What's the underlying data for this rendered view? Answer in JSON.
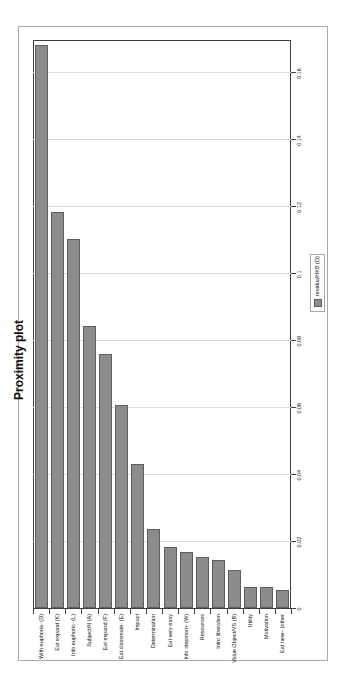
{
  "title": "Proximity plot",
  "legend": {
    "label": "residualHKB (D)"
  },
  "colors": {
    "bar_fill": "#8c8c8c",
    "bar_border": "#5e5e5e",
    "gridline": "#dcdcdc",
    "axis": "#3f3f3f",
    "chart_border": "#a8a8a8",
    "text": "#111111",
    "background": "#ffffff"
  },
  "chart_data": {
    "type": "bar",
    "orientation": "horizontal-bars",
    "rendered_rotation": "whole chart rotated 90 degrees counterclockwise in screenshot",
    "title": "Proximity plot",
    "xlabel": "",
    "ylabel": "",
    "grid": true,
    "legend_position": "bottom-center",
    "categories": [
      "With euphoria- (D)",
      "Eat expand (K)",
      "Info euphoric- (L)",
      "Subject/N (A)",
      "Eat expand (F)",
      "Eat classmate- (E)",
      "Impact",
      "Determination",
      "Eat very easy",
      "Info stepmom- (W)",
      "Resources",
      "Intro liberation",
      "Value Object/VS (B)",
      "Utility",
      "Motivation",
      "Eat new~ (other"
    ],
    "values": [
      0.168,
      0.118,
      0.11,
      0.084,
      0.0755,
      0.0605,
      0.0427,
      0.0233,
      0.0179,
      0.0165,
      0.0149,
      0.014,
      0.011,
      0.006,
      0.006,
      0.005
    ],
    "series_name": "residualHKB (D)",
    "value_axis": {
      "min": 0,
      "max": 0.17,
      "tick_interval": 0.02,
      "tick_labels": [
        "0",
        "0.02",
        "0.04",
        "0.06",
        "0.08",
        "0.1",
        "0.12",
        "0.14",
        "0.16"
      ]
    }
  }
}
